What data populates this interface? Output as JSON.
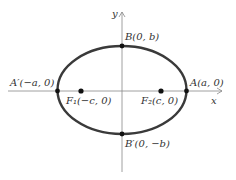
{
  "diagram": {
    "axes": {
      "x_label": "x",
      "y_label": "y"
    },
    "colors": {
      "ellipse": "#3a3a3a",
      "axis": "#888888",
      "point": "#111111",
      "text": "#333333"
    },
    "labels": {
      "B": "B(0, b)",
      "B_prime": "B′(0, −b)",
      "A": "A(a, 0)",
      "A_prime": "A′(−a, 0)",
      "F1": "F₁(−c, 0)",
      "F2": "F₂(c, 0)"
    }
  }
}
